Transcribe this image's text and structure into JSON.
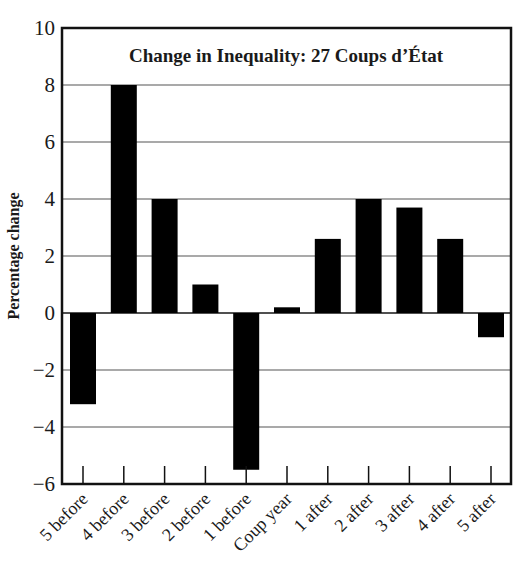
{
  "chart_data": {
    "type": "bar",
    "title": "Change in Inequality: 27 Coups d’État",
    "xlabel": "",
    "ylabel": "Percentage change",
    "categories": [
      "5 before",
      "4 before",
      "3 before",
      "2 before",
      "1 before",
      "Coup year",
      "1 after",
      "2 after",
      "3 after",
      "4 after",
      "5 after"
    ],
    "values": [
      -3.2,
      8.0,
      4.0,
      1.0,
      -5.5,
      0.2,
      2.6,
      4.0,
      3.7,
      2.6,
      -0.85
    ],
    "ylim": [
      -6,
      10
    ],
    "yticks": [
      -6,
      -4,
      -2,
      0,
      2,
      4,
      6,
      8,
      10
    ],
    "ytick_labels": [
      "−6",
      "−4",
      "−2",
      "0",
      "2",
      "4",
      "6",
      "8",
      "10"
    ],
    "grid": "horizontal",
    "legend": "none",
    "bar_color": "#000000"
  }
}
